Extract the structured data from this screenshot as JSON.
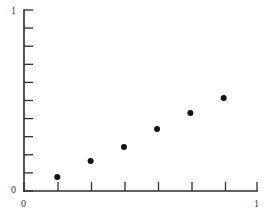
{
  "chart_data": {
    "type": "scatter",
    "title": "",
    "xlabel": "",
    "ylabel": "",
    "xlim": [
      0,
      1
    ],
    "ylim": [
      0,
      1
    ],
    "grid": false,
    "legend": null,
    "x": [
      0.143,
      0.286,
      0.429,
      0.571,
      0.714,
      0.857
    ],
    "y": [
      0.077,
      0.166,
      0.243,
      0.343,
      0.431,
      0.514
    ],
    "points": [
      {
        "x": 0.143,
        "y": 0.077
      },
      {
        "x": 0.286,
        "y": 0.166
      },
      {
        "x": 0.429,
        "y": 0.243
      },
      {
        "x": 0.571,
        "y": 0.343
      },
      {
        "x": 0.714,
        "y": 0.431
      },
      {
        "x": 0.857,
        "y": 0.514
      }
    ],
    "marker": {
      "shape": "circle",
      "color": "#121212",
      "radius_px": 3
    },
    "axes": {
      "color": "#2e2e2e",
      "x_ticks": [
        0,
        0.143,
        0.286,
        0.429,
        0.571,
        0.714,
        0.857,
        1
      ],
      "y_ticks": [
        0,
        0.1,
        0.2,
        0.3,
        0.4,
        0.5,
        0.6,
        0.7,
        0.8,
        0.9,
        1
      ],
      "x_tick_direction": "up",
      "y_tick_direction": "right"
    }
  },
  "labels": {
    "y_top": "1",
    "y_bottom": "0",
    "x_left": "0",
    "x_right": "1"
  }
}
